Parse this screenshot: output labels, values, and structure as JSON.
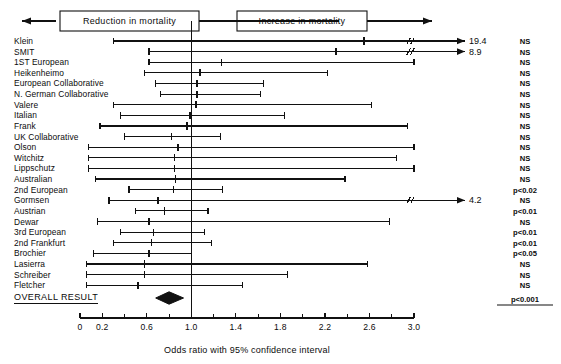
{
  "figure": {
    "left_header": "Reduction in mortality",
    "right_header": "Increase in mortality",
    "overall_label": "OVERALL RESULT",
    "axis_title": "Odds ratio with 95% confidence interval",
    "ink": "#111111"
  },
  "chart_data": {
    "type": "forest",
    "title": "",
    "xlabel": "Odds ratio with 95% confidence interval",
    "ylabel": "",
    "xlim": [
      0,
      3.0
    ],
    "null_line": 1.0,
    "grid": false,
    "tick_labels": [
      "0",
      "0.2",
      "0.6",
      "1.0",
      "1.4",
      "1.8",
      "2.2",
      "2.6",
      "3.0"
    ],
    "tick_values": [
      0,
      0.2,
      0.6,
      1.0,
      1.4,
      1.8,
      2.2,
      2.6,
      3.0
    ],
    "minor_tick_values": [
      0.4,
      0.8,
      1.2,
      1.6,
      2.0,
      2.4,
      2.8
    ],
    "categories": [
      "Klein",
      "SMIT",
      "1ST European",
      "Heikenheimo",
      "European Collaborative",
      "N. German Collaborative",
      "Valere",
      "Italian",
      "Frank",
      "UK Collaborative",
      "Olson",
      "Witchitz",
      "Lippschutz",
      "Australian",
      "2nd European",
      "Gormsen",
      "Austrian",
      "Dewar",
      "3rd European",
      "2nd Frankfurt",
      "Brochier",
      "Lasierra",
      "Schreiber",
      "Fletcher"
    ],
    "points": [
      {
        "study": "Klein",
        "or": 2.55,
        "low": 0.3,
        "high": 19.4,
        "high_clipped": true,
        "upper_label": "19.4",
        "significance": "NS"
      },
      {
        "study": "SMIT",
        "or": 2.3,
        "low": 0.62,
        "high": 8.9,
        "high_clipped": true,
        "upper_label": "8.9",
        "significance": "NS"
      },
      {
        "study": "1ST European",
        "or": 1.27,
        "low": 0.62,
        "high": 3.0,
        "high_clipped": false,
        "upper_label": "",
        "significance": "NS"
      },
      {
        "study": "Heikenheimo",
        "or": 1.08,
        "low": 0.58,
        "high": 2.22,
        "high_clipped": false,
        "upper_label": "",
        "significance": "NS"
      },
      {
        "study": "European Collaborative",
        "or": 1.05,
        "low": 0.68,
        "high": 1.65,
        "high_clipped": false,
        "upper_label": "",
        "significance": "NS"
      },
      {
        "study": "N. German Collaborative",
        "or": 1.05,
        "low": 0.72,
        "high": 1.62,
        "high_clipped": false,
        "upper_label": "",
        "significance": "NS"
      },
      {
        "study": "Valere",
        "or": 1.04,
        "low": 0.3,
        "high": 2.62,
        "high_clipped": false,
        "upper_label": "",
        "significance": "NS"
      },
      {
        "study": "Italian",
        "or": 0.99,
        "low": 0.36,
        "high": 1.84,
        "high_clipped": false,
        "upper_label": "",
        "significance": "NS"
      },
      {
        "study": "Frank",
        "or": 0.96,
        "low": 0.18,
        "high": 2.94,
        "high_clipped": false,
        "upper_label": "",
        "significance": "NS"
      },
      {
        "study": "UK Collaborative",
        "or": 0.82,
        "low": 0.4,
        "high": 1.26,
        "high_clipped": false,
        "upper_label": "",
        "significance": "NS"
      },
      {
        "study": "Olson",
        "or": 0.88,
        "low": 0.08,
        "high": 3.0,
        "high_clipped": false,
        "upper_label": "",
        "significance": "NS"
      },
      {
        "study": "Witchitz",
        "or": 0.85,
        "low": 0.08,
        "high": 2.84,
        "high_clipped": false,
        "upper_label": "",
        "significance": "NS"
      },
      {
        "study": "Lippschutz",
        "or": 0.85,
        "low": 0.08,
        "high": 3.0,
        "high_clipped": false,
        "upper_label": "",
        "significance": "NS"
      },
      {
        "study": "Australian",
        "or": 0.86,
        "low": 0.14,
        "high": 2.38,
        "high_clipped": false,
        "upper_label": "",
        "significance": "NS"
      },
      {
        "study": "2nd European",
        "or": 0.84,
        "low": 0.44,
        "high": 1.28,
        "high_clipped": false,
        "upper_label": "",
        "significance": "p<0.02"
      },
      {
        "study": "Gormsen",
        "or": 0.7,
        "low": 0.26,
        "high": 4.2,
        "high_clipped": true,
        "upper_label": "4.2",
        "significance": "NS"
      },
      {
        "study": "Austrian",
        "or": 0.76,
        "low": 0.5,
        "high": 1.15,
        "high_clipped": false,
        "upper_label": "",
        "significance": "p<0.01"
      },
      {
        "study": "Dewar",
        "or": 0.62,
        "low": 0.16,
        "high": 2.78,
        "high_clipped": false,
        "upper_label": "",
        "significance": "NS"
      },
      {
        "study": "3rd European",
        "or": 0.66,
        "low": 0.36,
        "high": 1.12,
        "high_clipped": false,
        "upper_label": "",
        "significance": "p<0.01"
      },
      {
        "study": "2nd Frankfurt",
        "or": 0.64,
        "low": 0.3,
        "high": 1.18,
        "high_clipped": false,
        "upper_label": "",
        "significance": "p<0.01"
      },
      {
        "study": "Brochier",
        "or": 0.62,
        "low": 0.12,
        "high": 1.0,
        "high_clipped": false,
        "upper_label": "",
        "significance": "p<0.05"
      },
      {
        "study": "Lasierra",
        "or": 0.58,
        "low": 0.06,
        "high": 2.58,
        "high_clipped": false,
        "upper_label": "",
        "significance": "NS"
      },
      {
        "study": "Schreiber",
        "or": 0.58,
        "low": 0.06,
        "high": 1.86,
        "high_clipped": false,
        "upper_label": "",
        "significance": "NS"
      },
      {
        "study": "Fletcher",
        "or": 0.52,
        "low": 0.06,
        "high": 1.46,
        "high_clipped": false,
        "upper_label": "",
        "significance": "NS"
      }
    ],
    "overall": {
      "label": "OVERALL RESULT",
      "or": 0.8,
      "low": 0.68,
      "high": 0.93,
      "significance": "p<0.001",
      "marker": "diamond"
    }
  }
}
